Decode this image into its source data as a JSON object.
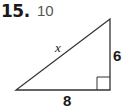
{
  "problem": {
    "number": "15.",
    "answer": "10"
  },
  "figure": {
    "type": "right-triangle",
    "hypotenuse_label": "x",
    "vertical_leg_label": "6",
    "horizontal_leg_label": "8",
    "right_angle_marker": "bottom-right",
    "stroke_color": "#333333"
  }
}
